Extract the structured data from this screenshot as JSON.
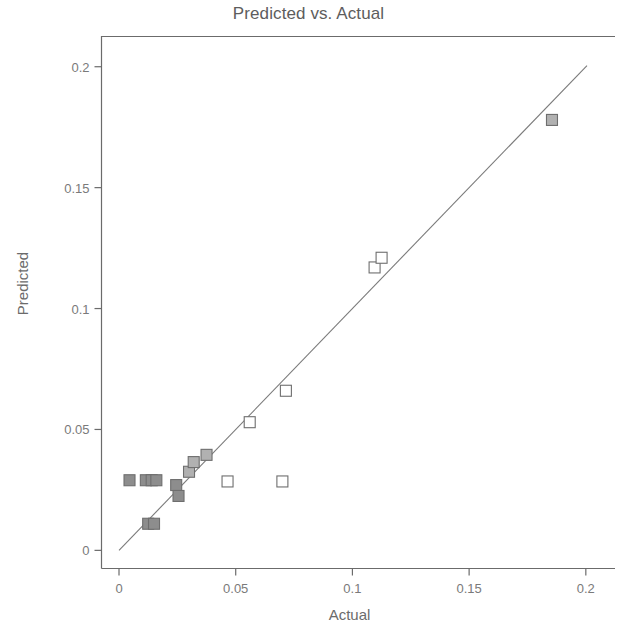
{
  "chart_data": {
    "type": "scatter",
    "title": "Predicted vs. Actual",
    "xlabel": "Actual",
    "ylabel": "Predicted",
    "xlim": [
      -0.0075,
      0.2125
    ],
    "ylim": [
      -0.0075,
      0.2125
    ],
    "grid": false,
    "legend": "none",
    "x_ticks": [
      0,
      0.05,
      0.1,
      0.15,
      0.2
    ],
    "x_tick_labels": [
      "0",
      "0.05",
      "0.1",
      "0.15",
      "0.2"
    ],
    "y_ticks": [
      0,
      0.05,
      0.1,
      0.15,
      0.2
    ],
    "y_tick_labels": [
      "0",
      "0.05",
      "0.1",
      "0.15",
      "0.2"
    ],
    "reference_line": {
      "name": "identity-line",
      "x0": 0.0,
      "y0": 0.0,
      "x1": 0.2005,
      "y1": 0.2005,
      "color": "#7a7a7a"
    },
    "marker": {
      "shape": "square",
      "size_px": 11,
      "edge_color": "#6e6e6e",
      "fill_dark": "#8d8d8d",
      "fill_mid": "#b1b1b1",
      "fill_light": "#ffffff"
    },
    "series": [
      {
        "name": "observations",
        "points": [
          {
            "x": 0.0045,
            "y": 0.029,
            "fill": "dark"
          },
          {
            "x": 0.0115,
            "y": 0.029,
            "fill": "dark"
          },
          {
            "x": 0.014,
            "y": 0.029,
            "fill": "dark"
          },
          {
            "x": 0.016,
            "y": 0.029,
            "fill": "dark"
          },
          {
            "x": 0.0125,
            "y": 0.011,
            "fill": "dark"
          },
          {
            "x": 0.015,
            "y": 0.011,
            "fill": "dark"
          },
          {
            "x": 0.0245,
            "y": 0.027,
            "fill": "dark"
          },
          {
            "x": 0.0255,
            "y": 0.0225,
            "fill": "dark"
          },
          {
            "x": 0.03,
            "y": 0.0325,
            "fill": "mid"
          },
          {
            "x": 0.032,
            "y": 0.0365,
            "fill": "mid"
          },
          {
            "x": 0.0375,
            "y": 0.0395,
            "fill": "mid"
          },
          {
            "x": 0.0465,
            "y": 0.0285,
            "fill": "light"
          },
          {
            "x": 0.07,
            "y": 0.0285,
            "fill": "light"
          },
          {
            "x": 0.056,
            "y": 0.053,
            "fill": "light"
          },
          {
            "x": 0.0715,
            "y": 0.066,
            "fill": "light"
          },
          {
            "x": 0.1095,
            "y": 0.117,
            "fill": "light"
          },
          {
            "x": 0.1125,
            "y": 0.121,
            "fill": "light"
          },
          {
            "x": 0.1855,
            "y": 0.178,
            "fill": "mid"
          }
        ]
      }
    ]
  },
  "colors": {
    "background": "#ffffff",
    "axis": "#6b6b6b",
    "text": "#6b6b6b",
    "line": "#7a7a7a"
  }
}
